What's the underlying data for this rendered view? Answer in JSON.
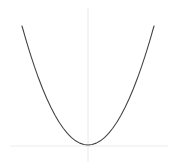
{
  "figure": {
    "width": 178,
    "height": 165,
    "background_color": "#ffffff",
    "title": "",
    "caption": ""
  },
  "style": {
    "curve_color": "#444444",
    "curve_width": 1.1,
    "xaxis_color": "#ececec",
    "yaxis_color": "#e8e8e8",
    "axis_width": 1
  },
  "axes": {
    "x_axis": {
      "name": "horizontal-axis",
      "y_px": 146,
      "x_start_px": 10,
      "x_end_px": 168,
      "label": "",
      "ticks": [],
      "tick_labels": []
    },
    "y_axis": {
      "name": "vertical-axis",
      "x_px": 88,
      "y_start_px": 8,
      "y_end_px": 162,
      "label": "",
      "ticks": [],
      "tick_labels": []
    }
  },
  "chart_data": {
    "type": "line",
    "title": "",
    "subtitle": "",
    "xlabel": "",
    "ylabel": "",
    "grid": false,
    "legend": null,
    "legend_position": "none",
    "annotations": [],
    "xlim": [
      -4,
      4
    ],
    "ylim": [
      0,
      16
    ],
    "function": "y = x^2",
    "vertex": [
      0,
      0
    ],
    "series": [
      {
        "name": "y = x^2",
        "color": "#444444",
        "x": [
          -4,
          -3.75,
          -3.5,
          -3.25,
          -3,
          -2.75,
          -2.5,
          -2.25,
          -2,
          -1.75,
          -1.5,
          -1.25,
          -1,
          -0.75,
          -0.5,
          -0.25,
          0,
          0.25,
          0.5,
          0.75,
          1,
          1.25,
          1.5,
          1.75,
          2,
          2.25,
          2.5,
          2.75,
          3,
          3.25,
          3.5,
          3.75,
          4
        ],
        "values": [
          16,
          14.0625,
          12.25,
          10.5625,
          9,
          7.5625,
          6.25,
          5.0625,
          4,
          3.0625,
          2.25,
          1.5625,
          1,
          0.5625,
          0.25,
          0.0625,
          0,
          0.0625,
          0.25,
          0.5625,
          1,
          1.5625,
          2.25,
          3.0625,
          4,
          5.0625,
          6.25,
          7.5625,
          9,
          10.5625,
          12.25,
          14.0625,
          16
        ]
      }
    ],
    "pixel_geometry": {
      "vertex_px": [
        88,
        145
      ],
      "left_endpoint_px": [
        24,
        26
      ],
      "right_endpoint_px": [
        156,
        26
      ],
      "coefficient_a_px": 0.029
    }
  }
}
